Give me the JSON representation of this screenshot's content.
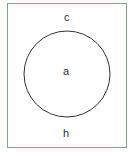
{
  "diagram": {
    "type": "venn",
    "universe_label": "c",
    "set_label": "a",
    "outside_label": "h",
    "frame_color": "#7fa88a",
    "circle_color": "#333333"
  }
}
